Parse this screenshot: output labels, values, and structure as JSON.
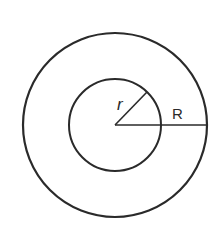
{
  "diagram": {
    "type": "concentric-circles",
    "center": [
      115,
      125
    ],
    "outer_circle": {
      "radius": 92
    },
    "inner_circle": {
      "radius": 46
    },
    "stroke_color": "#2a2a2a",
    "background": "#ffffff",
    "labels": {
      "inner_radius": "r",
      "outer_radius": "R"
    }
  }
}
